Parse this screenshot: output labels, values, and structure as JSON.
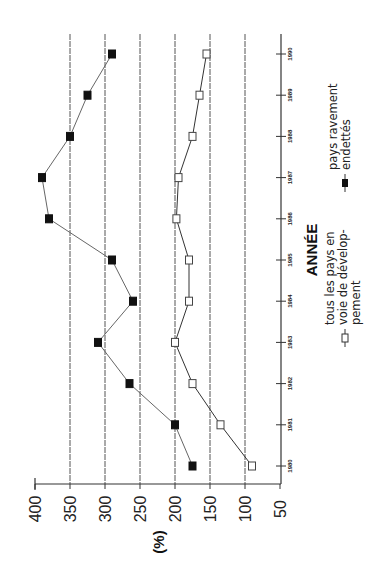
{
  "chart_data": {
    "type": "line",
    "orientation": "rotated 90deg counter-clockwise (years run bottom-to-top, values run right-to-left)",
    "title": "",
    "xlabel": "ANNÉE",
    "ylabel": "(%)",
    "categories": [
      "1980",
      "1981",
      "1982",
      "1983",
      "1984",
      "1985",
      "1986",
      "1987",
      "1988",
      "1989",
      "1990"
    ],
    "series": [
      {
        "name": "pays ravement endettés",
        "marker": "filled-square",
        "values": [
          175,
          200,
          265,
          310,
          260,
          290,
          380,
          390,
          350,
          325,
          290
        ]
      },
      {
        "name": "tous les pays en voie de dévelop-pement",
        "marker": "open-square",
        "values": [
          90,
          135,
          175,
          200,
          180,
          180,
          198,
          195,
          175,
          165,
          155
        ]
      }
    ],
    "ylim": [
      50,
      400
    ],
    "yticks": [
      "400",
      "350",
      "300",
      "250",
      "200",
      "150",
      "100",
      "50"
    ],
    "grid": true,
    "gridlines_at": [
      100,
      150,
      200,
      250,
      300,
      350
    ],
    "legend": {
      "position": "right (rotated)",
      "entries": [
        {
          "label_lines": [
            "tous les pays en",
            "voie de dévelop-",
            "pement"
          ],
          "marker": "open-square"
        },
        {
          "label_lines": [
            "pays ravement",
            "endettés"
          ],
          "marker": "filled-square"
        }
      ]
    }
  },
  "labels": {
    "x_title": "ANNÉE",
    "y_title": "(%)"
  }
}
